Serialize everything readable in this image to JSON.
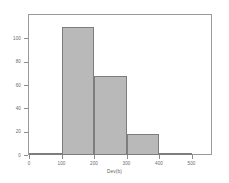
{
  "chart_data": {
    "type": "bar",
    "title": "",
    "subtitle": "",
    "xlabel": "Dev(b)",
    "ylabel": "",
    "categories": [
      "0-100",
      "100-200",
      "200-300",
      "300-400",
      "400-500"
    ],
    "bin_edges": [
      0,
      100,
      200,
      300,
      400,
      500
    ],
    "values": [
      2,
      110,
      68,
      18,
      2
    ],
    "series": [
      {
        "name": "Frequency",
        "values": [
          2,
          110,
          68,
          18,
          2
        ]
      }
    ],
    "x": [
      50,
      150,
      250,
      350,
      450
    ],
    "xlim": [
      0,
      560
    ],
    "ylim": [
      0,
      120
    ],
    "xticks": [
      0,
      100,
      200,
      300,
      400,
      500
    ],
    "xtick_labels": [
      "0",
      "100",
      "200",
      "300",
      "400",
      "500"
    ],
    "yticks": [
      0,
      20,
      40,
      60,
      80,
      100
    ],
    "ytick_labels": [
      "0",
      "20",
      "40",
      "60",
      "80",
      "100"
    ],
    "grid": false,
    "legend": false,
    "legend_position": "none",
    "bar_fill_color": "#b9b9b9",
    "bar_edge_color": "#7d7d7d",
    "frame_color": "#9a9a9a",
    "tick_color": "#8c8c8c",
    "label_color": "#6a6a6a",
    "background_color": "#ffffff"
  }
}
